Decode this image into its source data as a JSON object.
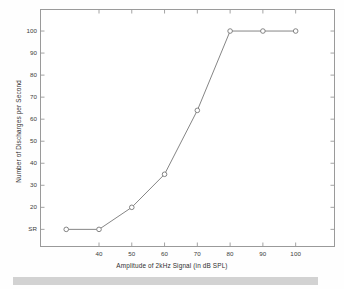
{
  "chart_data": {
    "type": "line",
    "title": "",
    "subtitle": "",
    "xlabel": "Amplitude of 2kHz Signal (in dB SPL)",
    "ylabel": "Number of Discharges per Second",
    "x": [
      30,
      40,
      50,
      60,
      70,
      80,
      90,
      100
    ],
    "values": [
      10,
      10,
      20,
      35,
      64,
      100,
      100,
      100
    ],
    "series": [
      {
        "name": "Rate-intensity function",
        "values": [
          10,
          10,
          20,
          35,
          64,
          100,
          100,
          100
        ]
      }
    ],
    "point_labels": [
      "SR",
      "SR",
      "20",
      "35",
      "64",
      "100",
      "100",
      "100"
    ],
    "xlim": [
      22,
      112
    ],
    "ylim": [
      2,
      110
    ],
    "xticks": [
      40,
      50,
      60,
      70,
      80,
      90,
      100
    ],
    "xtick_labels": [
      "40",
      "50",
      "60",
      "70",
      "80",
      "90",
      "100"
    ],
    "yticks": [
      10,
      20,
      30,
      40,
      50,
      60,
      70,
      80,
      90,
      100
    ],
    "ytick_labels": [
      "SR",
      "20",
      "30",
      "40",
      "50",
      "60",
      "70",
      "80",
      "90",
      "100"
    ],
    "grid": false,
    "legend": "none",
    "marker": "circle-open",
    "line_color": "#777777",
    "marker_color": "#777777",
    "axis_color": "#9a9a9a",
    "background_color": "#ffffff",
    "annotations": [
      {
        "text": "SR",
        "meaning": "spontaneous rate baseline",
        "x": 22,
        "y": 10
      }
    ]
  },
  "figure": {
    "footer_band_color": "#d2d2d2"
  }
}
